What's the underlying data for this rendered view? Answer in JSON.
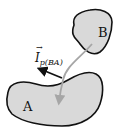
{
  "diagram": {
    "bodies": [
      {
        "id": "A",
        "label": "A",
        "fill": "#d9d9d9",
        "stroke": "#111111"
      },
      {
        "id": "B",
        "label": "B",
        "fill": "#d9d9d9",
        "stroke": "#111111"
      }
    ],
    "impulse": {
      "symbol": "I",
      "subscript": "p(BA)",
      "arrow_color": "#111111"
    },
    "transfer_arrow": {
      "from": "B",
      "to": "A",
      "color": "#a6a6a6"
    }
  }
}
